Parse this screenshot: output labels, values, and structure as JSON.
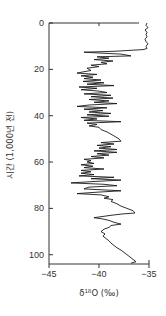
{
  "chart_data": {
    "type": "line",
    "orientation": "vertical-profile",
    "title": "",
    "xlabel": "δ18O (‰)",
    "xlabel_parts": {
      "delta": "δ",
      "superscript": "18",
      "rest": "O (‰)"
    },
    "ylabel": "시간 (1,000년 전)",
    "xlim": [
      -45,
      -35
    ],
    "ylim": [
      0,
      104
    ],
    "y_inverted": true,
    "x_ticks": [
      -45,
      -40,
      -35
    ],
    "x_tick_labels": [
      "-45",
      "-40",
      "-35"
    ],
    "y_ticks": [
      0,
      20,
      40,
      60,
      80,
      100
    ],
    "y_tick_labels": [
      "0",
      "20",
      "40",
      "60",
      "80",
      "100"
    ],
    "grid": false,
    "legend": null,
    "series": [
      {
        "name": "δ18O",
        "color": "#1a1a1a",
        "points": [
          [
            -35.2,
            0
          ],
          [
            -35.3,
            1
          ],
          [
            -35.1,
            2
          ],
          [
            -35.4,
            3
          ],
          [
            -35.2,
            4
          ],
          [
            -35.3,
            5
          ],
          [
            -35.2,
            6
          ],
          [
            -35.4,
            7
          ],
          [
            -35.3,
            8
          ],
          [
            -35.1,
            9
          ],
          [
            -35.3,
            10
          ],
          [
            -35.2,
            11
          ],
          [
            -35.6,
            11.5
          ],
          [
            -38.5,
            12.2
          ],
          [
            -41.5,
            12.6
          ],
          [
            -39.8,
            13.0
          ],
          [
            -37.8,
            13.4
          ],
          [
            -36.8,
            14.2
          ],
          [
            -40.2,
            14.6
          ],
          [
            -39.0,
            15.2
          ],
          [
            -40.5,
            15.8
          ],
          [
            -38.6,
            16.4
          ],
          [
            -39.8,
            17.0
          ],
          [
            -39.2,
            17.6
          ],
          [
            -40.8,
            18.2
          ],
          [
            -40.0,
            18.8
          ],
          [
            -41.2,
            19.5
          ],
          [
            -40.8,
            20.5
          ],
          [
            -41.5,
            21.0
          ],
          [
            -42.2,
            21.6
          ],
          [
            -40.2,
            22.2
          ],
          [
            -41.8,
            22.8
          ],
          [
            -40.6,
            23.4
          ],
          [
            -41.5,
            24.0
          ],
          [
            -39.8,
            24.6
          ],
          [
            -41.6,
            25.2
          ],
          [
            -39.5,
            25.8
          ],
          [
            -41.2,
            26.4
          ],
          [
            -38.5,
            27.0
          ],
          [
            -42.0,
            27.6
          ],
          [
            -40.2,
            28.2
          ],
          [
            -41.8,
            28.8
          ],
          [
            -40.0,
            29.4
          ],
          [
            -39.2,
            30.0
          ],
          [
            -41.5,
            30.6
          ],
          [
            -38.8,
            31.2
          ],
          [
            -40.8,
            31.8
          ],
          [
            -38.6,
            32.4
          ],
          [
            -41.0,
            33.0
          ],
          [
            -39.0,
            33.6
          ],
          [
            -40.5,
            34.2
          ],
          [
            -38.2,
            34.8
          ],
          [
            -41.0,
            35.4
          ],
          [
            -42.2,
            36.0
          ],
          [
            -39.2,
            36.6
          ],
          [
            -41.5,
            37.2
          ],
          [
            -39.6,
            37.8
          ],
          [
            -41.0,
            38.4
          ],
          [
            -38.8,
            39.0
          ],
          [
            -41.2,
            39.6
          ],
          [
            -39.0,
            40.2
          ],
          [
            -41.8,
            40.8
          ],
          [
            -40.2,
            41.4
          ],
          [
            -41.5,
            42.0
          ],
          [
            -37.8,
            42.6
          ],
          [
            -41.2,
            43.2
          ],
          [
            -40.2,
            43.8
          ],
          [
            -41.0,
            44.4
          ],
          [
            -40.0,
            45.0
          ],
          [
            -39.8,
            46.0
          ],
          [
            -39.2,
            47.0
          ],
          [
            -38.8,
            48.0
          ],
          [
            -38.4,
            49.0
          ],
          [
            -38.0,
            50.0
          ],
          [
            -37.8,
            51.0
          ],
          [
            -39.8,
            51.6
          ],
          [
            -38.5,
            52.2
          ],
          [
            -40.2,
            52.8
          ],
          [
            -38.8,
            53.4
          ],
          [
            -40.0,
            54.0
          ],
          [
            -38.2,
            54.6
          ],
          [
            -40.5,
            55.2
          ],
          [
            -38.2,
            55.8
          ],
          [
            -40.2,
            56.4
          ],
          [
            -39.0,
            57.0
          ],
          [
            -40.8,
            57.6
          ],
          [
            -39.5,
            58.2
          ],
          [
            -41.5,
            58.8
          ],
          [
            -40.8,
            59.4
          ],
          [
            -41.2,
            60.0
          ],
          [
            -40.5,
            60.6
          ],
          [
            -41.8,
            61.2
          ],
          [
            -40.6,
            61.8
          ],
          [
            -41.5,
            62.4
          ],
          [
            -39.5,
            63.0
          ],
          [
            -41.8,
            63.6
          ],
          [
            -40.8,
            64.2
          ],
          [
            -41.8,
            64.8
          ],
          [
            -40.5,
            65.4
          ],
          [
            -42.0,
            66.0
          ],
          [
            -38.5,
            66.6
          ],
          [
            -40.8,
            67.2
          ],
          [
            -37.8,
            67.8
          ],
          [
            -40.5,
            68.4
          ],
          [
            -42.8,
            69.0
          ],
          [
            -39.5,
            69.6
          ],
          [
            -38.2,
            70.2
          ],
          [
            -41.0,
            70.8
          ],
          [
            -41.5,
            71.6
          ],
          [
            -37.8,
            72.4
          ],
          [
            -40.2,
            73.0
          ],
          [
            -42.2,
            73.6
          ],
          [
            -39.8,
            74.2
          ],
          [
            -39.0,
            75.0
          ],
          [
            -39.5,
            75.6
          ],
          [
            -38.6,
            76.2
          ],
          [
            -38.8,
            77.0
          ],
          [
            -38.2,
            78.0
          ],
          [
            -37.8,
            79.0
          ],
          [
            -37.2,
            80.0
          ],
          [
            -36.6,
            81.0
          ],
          [
            -36.4,
            82.0
          ],
          [
            -37.6,
            82.4
          ],
          [
            -38.8,
            83.0
          ],
          [
            -40.5,
            84.0
          ],
          [
            -39.6,
            84.6
          ],
          [
            -39.0,
            85.2
          ],
          [
            -38.5,
            86.0
          ],
          [
            -37.8,
            86.8
          ],
          [
            -38.8,
            87.4
          ],
          [
            -39.0,
            88.2
          ],
          [
            -39.5,
            89.0
          ],
          [
            -39.8,
            90.0
          ],
          [
            -39.4,
            91.0
          ],
          [
            -39.6,
            92.0
          ],
          [
            -39.3,
            93.0
          ],
          [
            -39.0,
            94.0
          ],
          [
            -38.8,
            95.0
          ],
          [
            -38.5,
            96.0
          ],
          [
            -38.2,
            97.0
          ],
          [
            -37.8,
            98.0
          ],
          [
            -37.5,
            99.0
          ],
          [
            -37.2,
            100.0
          ],
          [
            -36.9,
            101.0
          ],
          [
            -36.6,
            102.0
          ],
          [
            -36.3,
            103.0
          ],
          [
            -36.8,
            103.6
          ]
        ]
      }
    ]
  },
  "layout_hints": {
    "plot_left_px": 49,
    "plot_right_px": 149,
    "plot_top_px": 23,
    "plot_bottom_px": 264
  }
}
